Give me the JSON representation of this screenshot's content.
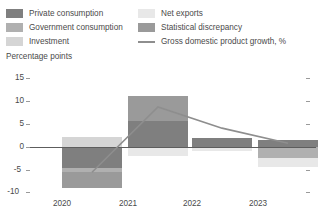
{
  "legend": {
    "left_items": [
      {
        "label": "Private consumption",
        "color": "#7f7f7f",
        "icon": "legend-swatch"
      },
      {
        "label": "Government consumption",
        "color": "#b0b0b0",
        "icon": "legend-swatch"
      },
      {
        "label": "Investment",
        "color": "#d5d5d5",
        "icon": "legend-swatch"
      }
    ],
    "right_items": [
      {
        "label": "Net exports",
        "color": "#e8e8e8",
        "icon": "legend-swatch"
      },
      {
        "label": "Statistical discrepancy",
        "color": "#9a9a9a",
        "icon": "legend-swatch"
      }
    ],
    "line_item": {
      "label": "Gross domestic product growth, %",
      "color": "#8e8e8e",
      "icon": "legend-line"
    }
  },
  "axis": {
    "y_title": "Percentage points",
    "y_ticks": [
      "15",
      "10",
      "5",
      "0",
      "-5",
      "-10"
    ],
    "x_labels": [
      "2020",
      "2021",
      "2022",
      "2023"
    ]
  },
  "chart_data": {
    "type": "bar",
    "title": "",
    "subtitle": "",
    "xlabel": "",
    "ylabel": "Percentage points",
    "ylim": [
      -10,
      15
    ],
    "grid": false,
    "legend_position": "top",
    "stacked": true,
    "categories": [
      "2020",
      "2021",
      "2022",
      "2023"
    ],
    "series": [
      {
        "name": "Private consumption",
        "color": "#7f7f7f",
        "values": [
          -4.6,
          5.6,
          2.0,
          1.5
        ]
      },
      {
        "name": "Government consumption",
        "color": "#b0b0b0",
        "values": [
          -0.8,
          0.0,
          0.0,
          -2.4
        ]
      },
      {
        "name": "Investment",
        "color": "#d5d5d5",
        "values": [
          2.2,
          0.0,
          0.0,
          0.0
        ]
      },
      {
        "name": "Net exports",
        "color": "#e8e8e8",
        "values": [
          0.0,
          -2.0,
          -0.8,
          -1.9
        ]
      },
      {
        "name": "Statistical discrepancy",
        "color": "#9a9a9a",
        "values": [
          -3.5,
          5.4,
          0.0,
          0.0
        ]
      }
    ],
    "line_series": {
      "name": "Gross domestic product growth, %",
      "color": "#8e8e8e",
      "values": [
        -5.5,
        8.7,
        4.1,
        0.8
      ]
    }
  }
}
